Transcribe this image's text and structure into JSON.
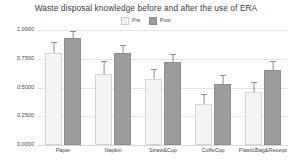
{
  "chart_data": {
    "type": "bar",
    "title": "Waste disposal knowledge before and after the use of ERA",
    "xlabel": "",
    "ylabel": "",
    "ylim": [
      0.0,
      1.0
    ],
    "grid": true,
    "legend_position": "top-center",
    "categories": [
      "Paper",
      "Napkin",
      "Straw&Cup",
      "CoffeCup",
      "PlasticBag&Receipt"
    ],
    "ytick_labels": [
      "1.0000",
      "0.7500",
      "0.5000",
      "0.2500",
      "0.0000"
    ],
    "ytick_values": [
      1.0,
      0.75,
      0.5,
      0.25,
      0.0
    ],
    "series": [
      {
        "name": "Pre",
        "color": "#f4f4f4",
        "values": [
          0.8,
          0.62,
          0.57,
          0.36,
          0.46
        ],
        "errors": [
          0.1,
          0.11,
          0.09,
          0.08,
          0.09
        ]
      },
      {
        "name": "Post",
        "color": "#9c9c9c",
        "values": [
          0.93,
          0.8,
          0.72,
          0.53,
          0.65
        ],
        "errors": [
          0.06,
          0.07,
          0.07,
          0.08,
          0.08
        ]
      }
    ]
  },
  "legend": {
    "items": [
      {
        "label": "Pre",
        "swatch": "pre"
      },
      {
        "label": "Post",
        "swatch": "post"
      }
    ]
  }
}
